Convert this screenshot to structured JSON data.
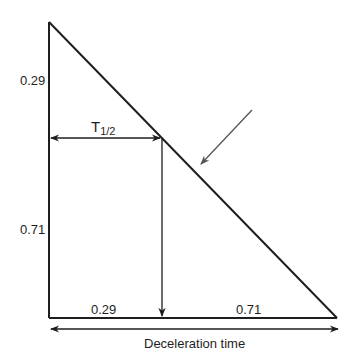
{
  "diagram": {
    "left_labels": {
      "upper": "0.29",
      "lower": "0.71"
    },
    "bottom_labels": {
      "left": "0.29",
      "right": "0.71"
    },
    "half_time_label": {
      "main": "T",
      "subscript": "1/2"
    },
    "x_axis_label": "Deceleration time",
    "colors": {
      "line": "#1e1e1e",
      "pointer_arrow": "#555555",
      "background": "#ffffff"
    }
  }
}
